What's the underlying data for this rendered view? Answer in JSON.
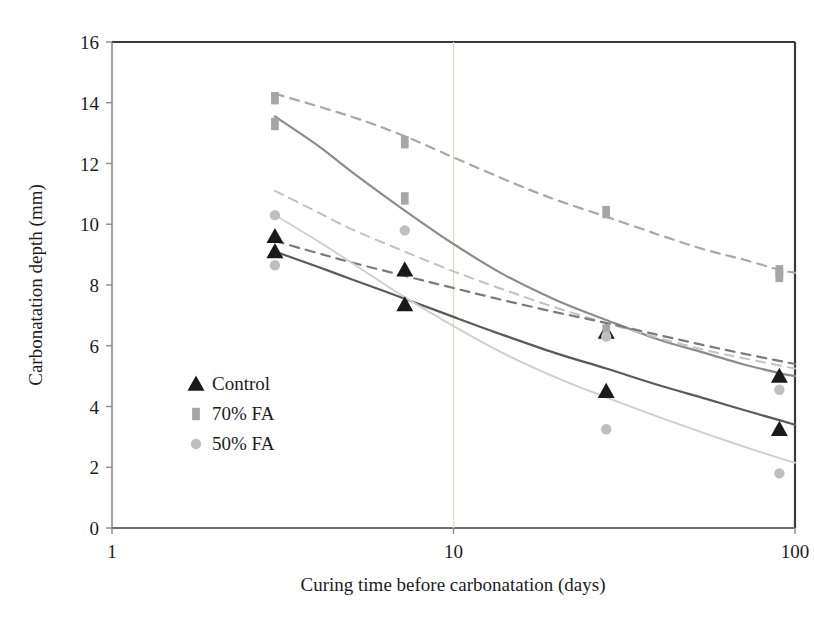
{
  "chart_data": {
    "type": "scatter",
    "title": "",
    "xlabel": "Curing time before carbonatation (days)",
    "ylabel": "Carbonatation depth (mm)",
    "xscale": "log",
    "xlim": [
      1,
      100
    ],
    "ylim": [
      0,
      16
    ],
    "xticks": [
      "1",
      "10",
      "100"
    ],
    "xtick_values": [
      1,
      10,
      100
    ],
    "yticks": [
      "0",
      "2",
      "4",
      "6",
      "8",
      "10",
      "12",
      "14",
      "16"
    ],
    "ytick_values": [
      0,
      2,
      4,
      6,
      8,
      10,
      12,
      14,
      16
    ],
    "grid": "vertical-minor-at-10",
    "legend_position": "inner-left-lower",
    "legend": [
      {
        "label": "Control",
        "marker": "triangle",
        "color": "#1a1a1a"
      },
      {
        "label": "70% FA",
        "marker": "square",
        "color": "#a6a6a6"
      },
      {
        "label": "50% FA",
        "marker": "circle",
        "color": "#bfbfbf"
      }
    ],
    "series": [
      {
        "name": "Control",
        "marker": "triangle",
        "color": "#1a1a1a",
        "points": [
          {
            "x": 3,
            "y": 9.6
          },
          {
            "x": 3,
            "y": 9.1
          },
          {
            "x": 7.2,
            "y": 8.5
          },
          {
            "x": 7.2,
            "y": 7.35
          },
          {
            "x": 28,
            "y": 6.45
          },
          {
            "x": 28,
            "y": 4.5
          },
          {
            "x": 90,
            "y": 5.0
          },
          {
            "x": 90,
            "y": 3.25
          }
        ]
      },
      {
        "name": "70% FA",
        "marker": "square",
        "color": "#a6a6a6",
        "points": [
          {
            "x": 3,
            "y": 14.15
          },
          {
            "x": 3,
            "y": 13.3
          },
          {
            "x": 7.2,
            "y": 12.7
          },
          {
            "x": 7.2,
            "y": 10.85
          },
          {
            "x": 28,
            "y": 10.4
          },
          {
            "x": 28,
            "y": 6.5
          },
          {
            "x": 90,
            "y": 8.45
          },
          {
            "x": 90,
            "y": 8.3
          }
        ]
      },
      {
        "name": "50% FA",
        "marker": "circle",
        "color": "#bfbfbf",
        "points": [
          {
            "x": 3,
            "y": 10.3
          },
          {
            "x": 3,
            "y": 8.65
          },
          {
            "x": 7.2,
            "y": 9.8
          },
          {
            "x": 28,
            "y": 6.3
          },
          {
            "x": 28,
            "y": 3.25
          },
          {
            "x": 90,
            "y": 4.55
          },
          {
            "x": 90,
            "y": 1.8
          }
        ]
      }
    ],
    "trend_curves": [
      {
        "name": "70% FA upper trend",
        "style": "dashed",
        "color": "#a8a8a8",
        "width": 2.2,
        "points": [
          [
            3,
            14.3
          ],
          [
            5,
            13.55
          ],
          [
            7.2,
            12.9
          ],
          [
            10,
            12.2
          ],
          [
            15,
            11.35
          ],
          [
            20,
            10.8
          ],
          [
            28,
            10.25
          ],
          [
            40,
            9.65
          ],
          [
            55,
            9.15
          ],
          [
            70,
            8.85
          ],
          [
            90,
            8.5
          ],
          [
            100,
            8.4
          ]
        ]
      },
      {
        "name": "70% FA lower solid trend",
        "style": "solid",
        "color": "#8c8c8c",
        "width": 2.2,
        "points": [
          [
            3,
            13.55
          ],
          [
            4,
            12.6
          ],
          [
            5,
            11.75
          ],
          [
            7.2,
            10.45
          ],
          [
            10,
            9.35
          ],
          [
            14,
            8.35
          ],
          [
            20,
            7.5
          ],
          [
            28,
            6.85
          ],
          [
            40,
            6.2
          ],
          [
            55,
            5.75
          ],
          [
            70,
            5.4
          ],
          [
            90,
            5.1
          ],
          [
            100,
            5.0
          ]
        ]
      },
      {
        "name": "50% FA dashed trend",
        "style": "dashed",
        "color": "#c2c2c2",
        "width": 2.0,
        "points": [
          [
            3,
            11.1
          ],
          [
            4,
            10.4
          ],
          [
            5,
            9.85
          ],
          [
            7.2,
            9.1
          ],
          [
            10,
            8.45
          ],
          [
            14,
            7.85
          ],
          [
            20,
            7.25
          ],
          [
            28,
            6.75
          ],
          [
            40,
            6.25
          ],
          [
            55,
            5.85
          ],
          [
            70,
            5.6
          ],
          [
            90,
            5.35
          ],
          [
            100,
            5.25
          ]
        ]
      },
      {
        "name": "Control dashed trend",
        "style": "dashed",
        "color": "#7a7a7a",
        "width": 2.2,
        "points": [
          [
            3,
            9.45
          ],
          [
            4,
            9.05
          ],
          [
            5,
            8.75
          ],
          [
            7.2,
            8.3
          ],
          [
            10,
            7.9
          ],
          [
            14,
            7.5
          ],
          [
            20,
            7.1
          ],
          [
            28,
            6.75
          ],
          [
            40,
            6.35
          ],
          [
            55,
            6.0
          ],
          [
            70,
            5.75
          ],
          [
            90,
            5.5
          ],
          [
            100,
            5.4
          ]
        ]
      },
      {
        "name": "Control solid trend",
        "style": "solid",
        "color": "#5a5a5a",
        "width": 2.2,
        "points": [
          [
            3,
            9.1
          ],
          [
            4,
            8.6
          ],
          [
            5,
            8.2
          ],
          [
            7.2,
            7.55
          ],
          [
            10,
            6.95
          ],
          [
            14,
            6.35
          ],
          [
            20,
            5.75
          ],
          [
            28,
            5.25
          ],
          [
            40,
            4.7
          ],
          [
            55,
            4.25
          ],
          [
            70,
            3.9
          ],
          [
            90,
            3.55
          ],
          [
            100,
            3.4
          ]
        ]
      },
      {
        "name": "50% FA solid trend",
        "style": "solid",
        "color": "#cfcfcf",
        "width": 2.0,
        "points": [
          [
            3,
            10.3
          ],
          [
            4,
            9.45
          ],
          [
            5,
            8.75
          ],
          [
            7.2,
            7.6
          ],
          [
            10,
            6.65
          ],
          [
            14,
            5.75
          ],
          [
            20,
            4.95
          ],
          [
            28,
            4.3
          ],
          [
            40,
            3.65
          ],
          [
            55,
            3.1
          ],
          [
            70,
            2.7
          ],
          [
            90,
            2.3
          ],
          [
            100,
            2.15
          ]
        ]
      }
    ]
  },
  "axes": {
    "y_title": "Carbonatation depth (mm)",
    "x_title": "Curing time before carbonatation (days)",
    "y_labels": [
      "16",
      "14",
      "12",
      "10",
      "8",
      "6",
      "4",
      "2",
      "0"
    ],
    "x_labels": [
      "1",
      "10",
      "100"
    ]
  },
  "legend": {
    "items": [
      {
        "label": "Control"
      },
      {
        "label": "70% FA"
      },
      {
        "label": "50% FA"
      }
    ]
  }
}
